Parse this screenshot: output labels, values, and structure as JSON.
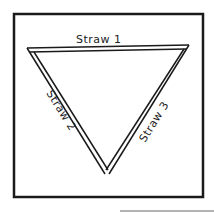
{
  "diagram": {
    "labels": {
      "straw1": "Straw 1",
      "straw2": "Straw 2",
      "straw3": "Straw 3"
    },
    "colors": {
      "line": "#1a1a1a",
      "background": "#ffffff"
    }
  }
}
